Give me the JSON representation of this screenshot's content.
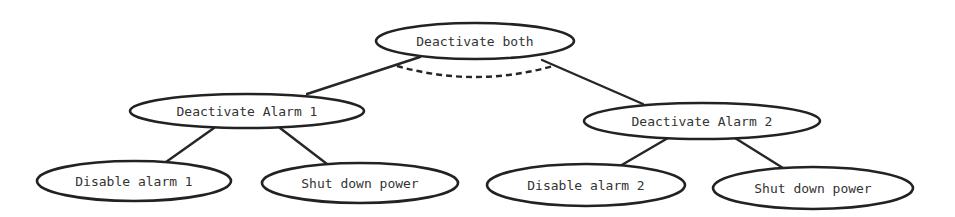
{
  "diagram": {
    "type": "attack-tree",
    "nodes": [
      {
        "id": "root",
        "label": "Deactivate both",
        "cx": 475,
        "cy": 41,
        "rx": 99,
        "ry": 18
      },
      {
        "id": "alarm1",
        "label": "Deactivate Alarm 1",
        "cx": 247,
        "cy": 111,
        "rx": 117,
        "ry": 17
      },
      {
        "id": "alarm2",
        "label": "Deactivate Alarm 2",
        "cx": 702,
        "cy": 121,
        "rx": 118,
        "ry": 18
      },
      {
        "id": "disable1",
        "label": "Disable alarm 1",
        "cx": 134,
        "cy": 181,
        "rx": 97,
        "ry": 20
      },
      {
        "id": "power1",
        "label": "Shut down power",
        "cx": 360,
        "cy": 183,
        "rx": 98,
        "ry": 20
      },
      {
        "id": "disable2",
        "label": "Disable alarm 2",
        "cx": 586,
        "cy": 185,
        "rx": 99,
        "ry": 21
      },
      {
        "id": "power2",
        "label": "Shut down power",
        "cx": 813,
        "cy": 188,
        "rx": 100,
        "ry": 21
      }
    ],
    "edges": [
      {
        "from": "root",
        "to": "alarm1",
        "x1": 420,
        "y1": 57,
        "x2": 307,
        "y2": 94
      },
      {
        "from": "root",
        "to": "alarm2",
        "x1": 542,
        "y1": 60,
        "x2": 643,
        "y2": 104
      },
      {
        "from": "alarm1",
        "to": "disable1",
        "x1": 214,
        "y1": 128,
        "x2": 166,
        "y2": 162
      },
      {
        "from": "alarm1",
        "to": "power1",
        "x1": 280,
        "y1": 128,
        "x2": 327,
        "y2": 164
      },
      {
        "from": "alarm2",
        "to": "disable2",
        "x1": 668,
        "y1": 138,
        "x2": 620,
        "y2": 166
      },
      {
        "from": "alarm2",
        "to": "power2",
        "x1": 735,
        "y1": 138,
        "x2": 783,
        "y2": 168
      }
    ],
    "and_arc": {
      "label": "AND connector",
      "style": "dashed",
      "x1": 397,
      "y1": 66,
      "cx": 475,
      "cy": 88,
      "x2": 553,
      "y2": 66
    }
  }
}
